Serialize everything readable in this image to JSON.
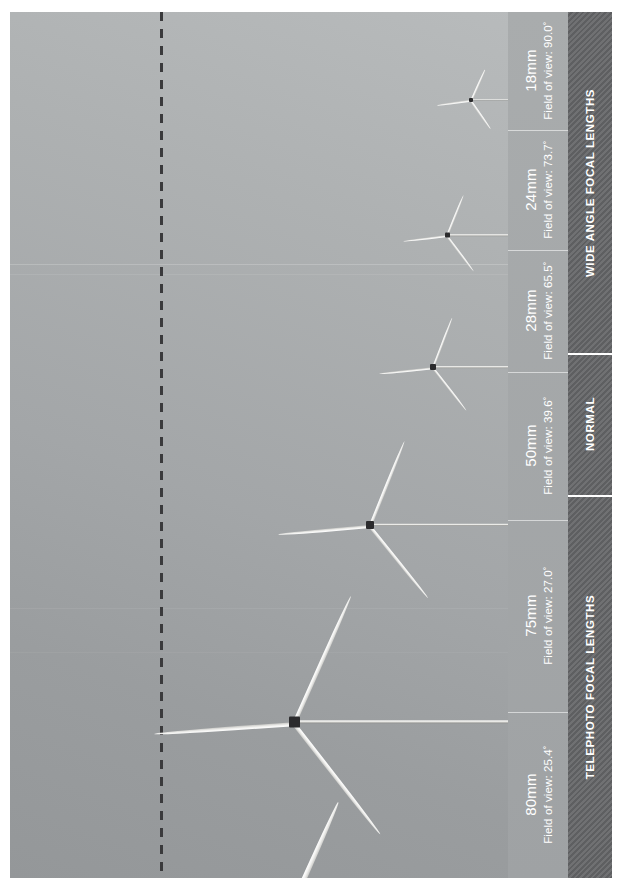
{
  "figure": {
    "type": "photographic-comparison",
    "orientation": "rotated-90-ccw",
    "background_color": "#a8abad",
    "reference_line": {
      "name": "vertical-dashed-line",
      "style": "dashed",
      "color": "#3a3a3c"
    }
  },
  "focal_lengths": [
    {
      "id": "18mm",
      "focal_label": "18mm",
      "fov_label": "Field of view: 90.0˚",
      "fov_value": 90.0,
      "category": "wide-angle"
    },
    {
      "id": "24mm",
      "focal_label": "24mm",
      "fov_label": "Field of view: 73.7˚",
      "fov_value": 73.7,
      "category": "wide-angle"
    },
    {
      "id": "28mm",
      "focal_label": "28mm",
      "fov_label": "Field of view: 65.5˚",
      "fov_value": 65.5,
      "category": "wide-angle"
    },
    {
      "id": "50mm",
      "focal_label": "50mm",
      "fov_label": "Field of view: 39.6˚",
      "fov_value": 39.6,
      "category": "normal"
    },
    {
      "id": "75mm",
      "focal_label": "75mm",
      "fov_label": "Field of view: 27.0˚",
      "fov_value": 27.0,
      "category": "telephoto"
    },
    {
      "id": "80mm",
      "focal_label": "80mm",
      "fov_label": "Field of view: 25.4˚",
      "fov_value": 25.4,
      "category": "telephoto"
    }
  ],
  "categories": [
    {
      "id": "wide-angle",
      "label": "WIDE ANGLE FOCAL LENGTHS"
    },
    {
      "id": "normal",
      "label": "NORMAL"
    },
    {
      "id": "telephoto",
      "label": "TELEPHOTO FOCAL LENGTHS"
    }
  ],
  "colors": {
    "label_strip": "#a4a7a9",
    "category_band": "#656668",
    "text": "#ffffff",
    "blade": "#f6f6f4",
    "nacelle": "#2b2b2d"
  }
}
